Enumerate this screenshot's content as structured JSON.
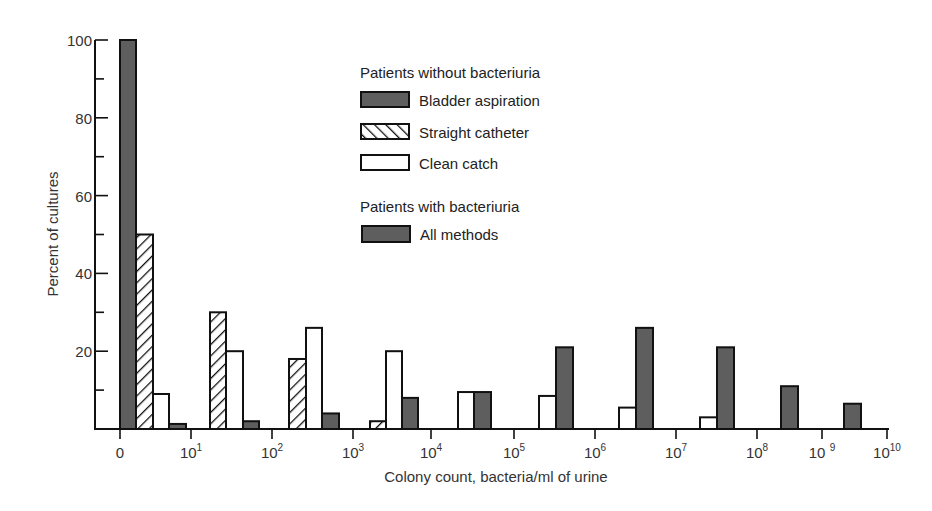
{
  "chart_data": {
    "type": "bar",
    "title": "",
    "xlabel": "Colony count, bacteria/ml of urine",
    "ylabel": "Percent of cultures",
    "ylim": [
      0,
      100
    ],
    "yticks": [
      0,
      20,
      40,
      60,
      80,
      100
    ],
    "ytick_labels": [
      "",
      "20",
      "40",
      "60",
      "80",
      "100"
    ],
    "x_tick_labels": [
      {
        "base": "0",
        "exp": ""
      },
      {
        "base": "10",
        "exp": "1"
      },
      {
        "base": "10",
        "exp": "2"
      },
      {
        "base": "10",
        "exp": "3"
      },
      {
        "base": "10",
        "exp": "4"
      },
      {
        "base": "10",
        "exp": "5"
      },
      {
        "base": "10",
        "exp": "6"
      },
      {
        "base": "10",
        "exp": "7"
      },
      {
        "base": "10",
        "exp": "8"
      },
      {
        "base": "10 ",
        "exp": "9"
      },
      {
        "base": "10",
        "exp": "10"
      }
    ],
    "categories": [
      "0–10^1",
      "10^1–10^2",
      "10^2–10^3",
      "10^3–10^4",
      "10^4–10^5",
      "10^5–10^6",
      "10^6–10^7",
      "10^7–10^8",
      "10^8–10^9",
      "10^9–10^10"
    ],
    "legend": {
      "groups": [
        {
          "heading": "Patients without bacteriuria",
          "entries": [
            {
              "label": "Bladder aspiration",
              "pattern": "solid-dark"
            },
            {
              "label": "Straight catheter",
              "pattern": "hatch"
            },
            {
              "label": "Clean catch",
              "pattern": "open"
            }
          ]
        },
        {
          "heading": "Patients with bacteriuria",
          "entries": [
            {
              "label": "All methods",
              "pattern": "solid-dark"
            }
          ]
        }
      ],
      "position": "upper-center"
    },
    "series": [
      {
        "name": "Bladder aspiration (without bacteriuria)",
        "values": [
          100,
          null,
          null,
          null,
          null,
          null,
          null,
          null,
          null,
          null
        ]
      },
      {
        "name": "Straight catheter (without bacteriuria)",
        "values": [
          50,
          30,
          18,
          2,
          null,
          null,
          null,
          null,
          null,
          null
        ]
      },
      {
        "name": "Clean catch (without bacteriuria)",
        "values": [
          9,
          20,
          26,
          20,
          9.5,
          8.5,
          5.5,
          3,
          null,
          null
        ]
      },
      {
        "name": "All methods (with bacteriuria)",
        "values": [
          1.3,
          2,
          4,
          8,
          9.5,
          21,
          26,
          21,
          11,
          6.5
        ]
      }
    ],
    "grid": false,
    "colors": {
      "dark_fill": "#5e5e5e",
      "outline": "#111111",
      "open_fill": "#ffffff"
    }
  },
  "bars": [
    {
      "series": "ba",
      "x": 120,
      "w": 16,
      "v": 100
    },
    {
      "series": "sc",
      "x": 136,
      "w": 17,
      "v": 50
    },
    {
      "series": "cc",
      "x": 153,
      "w": 16,
      "v": 9
    },
    {
      "series": "am",
      "x": 169,
      "w": 17,
      "v": 1.3
    },
    {
      "series": "sc",
      "x": 210,
      "w": 16,
      "v": 30
    },
    {
      "series": "cc",
      "x": 226,
      "w": 17,
      "v": 20
    },
    {
      "series": "am",
      "x": 243,
      "w": 16,
      "v": 2
    },
    {
      "series": "sc",
      "x": 289,
      "w": 17,
      "v": 18
    },
    {
      "series": "cc",
      "x": 306,
      "w": 16,
      "v": 26
    },
    {
      "series": "am",
      "x": 322,
      "w": 17,
      "v": 4
    },
    {
      "series": "sc",
      "x": 370,
      "w": 16,
      "v": 2
    },
    {
      "series": "cc",
      "x": 386,
      "w": 16,
      "v": 20
    },
    {
      "series": "am",
      "x": 402,
      "w": 16,
      "v": 8
    },
    {
      "series": "cc",
      "x": 458,
      "w": 16,
      "v": 9.5
    },
    {
      "series": "am",
      "x": 474,
      "w": 17,
      "v": 9.5
    },
    {
      "series": "cc",
      "x": 539,
      "w": 17,
      "v": 8.5
    },
    {
      "series": "am",
      "x": 556,
      "w": 17,
      "v": 21
    },
    {
      "series": "cc",
      "x": 619,
      "w": 17,
      "v": 5.5
    },
    {
      "series": "am",
      "x": 636,
      "w": 17,
      "v": 26
    },
    {
      "series": "cc",
      "x": 700,
      "w": 17,
      "v": 3
    },
    {
      "series": "am",
      "x": 717,
      "w": 17,
      "v": 21
    },
    {
      "series": "am",
      "x": 781,
      "w": 17,
      "v": 11
    },
    {
      "series": "am",
      "x": 844,
      "w": 17,
      "v": 6.5
    }
  ],
  "layout_ticks_x": [
    120,
    191,
    272,
    353,
    431,
    514,
    595,
    676,
    757,
    822,
    887
  ]
}
